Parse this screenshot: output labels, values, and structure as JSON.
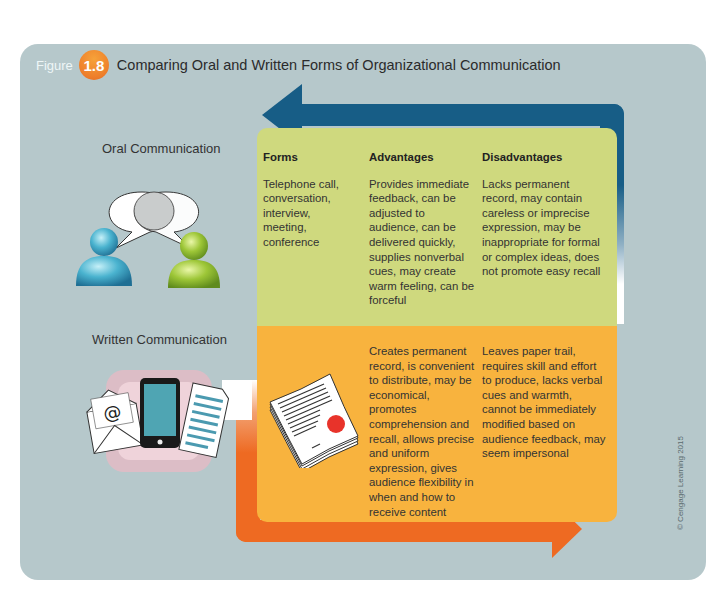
{
  "figure": {
    "word": "Figure",
    "number": "1.8",
    "title": "Comparing Oral and Written Forms of Organizational Communication"
  },
  "colors": {
    "panel_bg": "#b6c8cb",
    "blue_arrow": "#175d86",
    "orange_arrow": "#ee6a22",
    "green_box": "#cfd97e",
    "orange_box": "#f8b33e",
    "badge": "#ee7e2a"
  },
  "columns": {
    "forms": "Forms",
    "advantages": "Advantages",
    "disadvantages": "Disadvantages"
  },
  "oral": {
    "label": "Oral Communication",
    "forms": "Telephone call, conversation, interview, meeting, conference",
    "advantages": "Provides immediate feedback, can be adjusted to audience, can be delivered quickly, supplies nonverbal cues, may create warm feeling, can be forceful",
    "disadvantages": "Lacks permanent record, may contain careless or imprecise expression, may be inappropriate for formal or complex ideas, does not promote easy recall",
    "icons": [
      "speech-bubbles-icon",
      "person-blue-icon",
      "person-green-icon"
    ]
  },
  "written": {
    "label": "Written Communication",
    "advantages": "Creates permanent record, is convenient to distribute, may be economical, promotes comprehension and recall, allows precise and uniform expression, gives audience flexibility in when and how to receive content",
    "disadvantages": "Leaves paper trail, requires skill and effort to produce, lacks verbal cues and warmth, cannot be immediately modified based on audience feedback, may seem impersonal",
    "icons": [
      "email-envelope-icon",
      "tablet-icon",
      "document-icon",
      "sealed-document-stack-icon"
    ]
  },
  "copyright": "© Cengage Learning 2015"
}
